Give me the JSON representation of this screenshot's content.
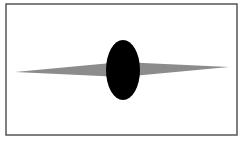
{
  "diagram": {
    "frame": {
      "x": 6,
      "y": 4,
      "width": 231,
      "height": 131,
      "stroke": "#555555"
    },
    "spindle": {
      "left_tip": [
        15,
        72
      ],
      "right_tip": [
        229,
        67
      ],
      "center_x": 122,
      "half_thickness": 7,
      "fill": "#8c8c8c"
    },
    "ellipse": {
      "cx": 123,
      "cy": 70,
      "rx": 17,
      "ry": 30,
      "fill": "#000000"
    }
  }
}
